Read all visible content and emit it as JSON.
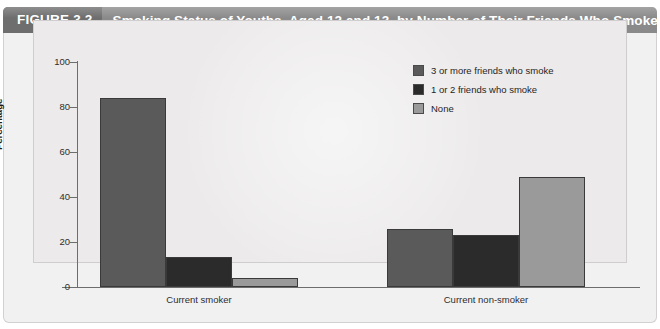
{
  "header": {
    "figure_number": "FIGURE 3.2",
    "title": "Smoking Status of Youths, Aged 12 and 13, by Number of Their Friends Who Smoke",
    "bar_color": "#8a8a8a",
    "number_block_color": "#6e6e6e",
    "text_color": "#ffffff"
  },
  "chart_data": {
    "type": "bar",
    "title": "Smoking Status of Youths, Aged 12 and 13, by Number of Their Friends Who Smoke",
    "xlabel": "",
    "ylabel": "Percentage",
    "categories": [
      "Current smoker",
      "Current non-smoker"
    ],
    "series": [
      {
        "name": "3 or more friends who smoke",
        "color": "#5a5a5a",
        "values": [
          84,
          26
        ]
      },
      {
        "name": "1 or 2 friends who smoke",
        "color": "#2b2b2b",
        "values": [
          13.5,
          23
        ]
      },
      {
        "name": "None",
        "color": "#9a9a9a",
        "values": [
          4,
          49
        ]
      }
    ],
    "ylim": [
      0,
      100
    ],
    "yticks": [
      "0",
      "20",
      "40",
      "60",
      "80",
      "100"
    ],
    "ytick_values": [
      0,
      20,
      40,
      60,
      80,
      100
    ],
    "grid": false,
    "legend_position": "top-right",
    "plot_background": "#eceaea",
    "axis_color": "#6d6d6d"
  },
  "legend": {
    "items": [
      {
        "label": "3 or more friends who smoke",
        "color": "#5a5a5a"
      },
      {
        "label": "1 or 2 friends who smoke",
        "color": "#2b2b2b"
      },
      {
        "label": "None",
        "color": "#9a9a9a"
      }
    ]
  }
}
